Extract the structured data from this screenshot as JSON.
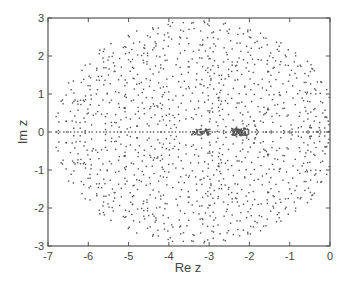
{
  "chart_data": {
    "type": "scatter",
    "title": "",
    "xlabel": "Re z",
    "ylabel": "Im z",
    "xlim": [
      -7,
      0
    ],
    "ylim": [
      -3,
      3
    ],
    "xticks": [
      -7,
      -6,
      -5,
      -4,
      -3,
      -2,
      -1,
      0
    ],
    "yticks": [
      -3,
      -2,
      -1,
      0,
      1,
      2,
      3
    ],
    "xtick_labels": [
      "-7",
      "-6",
      "-5",
      "-4",
      "-3",
      "-2",
      "-1",
      "0"
    ],
    "ytick_labels": [
      "-3",
      "-2",
      "-1",
      "0",
      "1",
      "2",
      "3"
    ],
    "grid": false,
    "legend": null,
    "marker_color": "#555555",
    "clusters": [
      {
        "center_re": -3.2,
        "center_im": 0.0,
        "spread_re": 0.25,
        "spread_im": 0.08,
        "count": 60
      },
      {
        "center_re": -2.25,
        "center_im": 0.0,
        "spread_re": 0.2,
        "spread_im": 0.1,
        "count": 90
      }
    ],
    "envelope": {
      "center_re": -3.3,
      "center_im": 0.0,
      "semi_re": 3.5,
      "semi_im": 2.9
    },
    "sample_points": [
      [
        -6.8,
        0.0
      ],
      [
        -6.5,
        0.0
      ],
      [
        -6.2,
        0.1
      ],
      [
        -6.2,
        -0.1
      ],
      [
        -6.0,
        0.5
      ],
      [
        -5.9,
        -0.5
      ],
      [
        -5.8,
        1.0
      ],
      [
        -5.7,
        -1.0
      ],
      [
        -5.5,
        1.5
      ],
      [
        -5.4,
        -1.5
      ],
      [
        -5.2,
        0.0
      ],
      [
        -5.0,
        1.9
      ],
      [
        -4.9,
        -1.9
      ],
      [
        -4.6,
        2.2
      ],
      [
        -4.5,
        -2.2
      ],
      [
        -4.2,
        0.0
      ],
      [
        -4.0,
        2.5
      ],
      [
        -3.9,
        -2.5
      ],
      [
        -3.5,
        2.7
      ],
      [
        -3.4,
        -2.7
      ],
      [
        -3.2,
        0.0
      ],
      [
        -3.0,
        2.8
      ],
      [
        -2.9,
        -2.8
      ],
      [
        -2.5,
        2.7
      ],
      [
        -2.4,
        -2.7
      ],
      [
        -2.2,
        0.0
      ],
      [
        -2.0,
        2.5
      ],
      [
        -1.9,
        -2.5
      ],
      [
        -1.5,
        2.0
      ],
      [
        -1.4,
        -2.0
      ],
      [
        -1.0,
        1.5
      ],
      [
        -1.0,
        -1.5
      ],
      [
        -0.5,
        0.8
      ],
      [
        -0.5,
        -0.8
      ],
      [
        -0.3,
        0.0
      ],
      [
        -0.1,
        0.4
      ],
      [
        -0.1,
        -0.4
      ]
    ]
  }
}
